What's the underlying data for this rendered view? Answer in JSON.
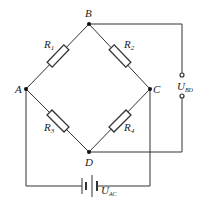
{
  "diagram": {
    "nodes": {
      "A": "A",
      "B": "B",
      "C": "C",
      "D": "D"
    },
    "resistors": [
      {
        "name": "R",
        "sub": "1"
      },
      {
        "name": "R",
        "sub": "2"
      },
      {
        "name": "R",
        "sub": "3"
      },
      {
        "name": "R",
        "sub": "4"
      }
    ],
    "voltmeter": {
      "name": "U",
      "sub": "BD"
    },
    "source": {
      "name": "U",
      "sub": "AC"
    },
    "colors": {
      "line": "#333333",
      "background": "#ffffff"
    }
  }
}
